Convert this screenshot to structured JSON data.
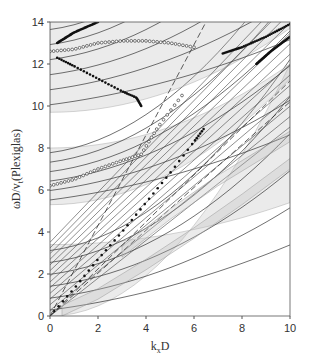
{
  "chart_data": {
    "type": "line",
    "title": "",
    "xlabel": "k_x D",
    "ylabel": "ωD/v_t (Plexiglas)",
    "xlim": [
      0,
      10
    ],
    "ylim": [
      0,
      14
    ],
    "xticks": [
      0,
      2,
      4,
      6,
      8,
      10
    ],
    "yticks": [
      0,
      2,
      4,
      6,
      8,
      10,
      12,
      14
    ],
    "grid": false,
    "legend": null,
    "series": [
      {
        "name": "dashed light line 1",
        "style": "dashed",
        "x": [
          0,
          6.5
        ],
        "y": [
          0,
          14
        ]
      },
      {
        "name": "dashed light line 2",
        "style": "dashed",
        "x": [
          0,
          10
        ],
        "y": [
          0,
          11.2
        ]
      },
      {
        "name": "dashed light line 3",
        "style": "dashed",
        "x": [
          0,
          10
        ],
        "y": [
          0,
          10.2
        ]
      },
      {
        "name": "lowest band (hatched)",
        "style": "band",
        "x": [
          0.5,
          2,
          4,
          6,
          8,
          10
        ],
        "y": [
          0,
          0.8,
          2.2,
          3.7,
          5.3,
          7.0
        ]
      },
      {
        "name": "second band (hatched)",
        "style": "band",
        "x": [
          3,
          5,
          7,
          10
        ],
        "y": [
          2.8,
          4.6,
          6.2,
          8.3
        ]
      },
      {
        "name": "filled-dot branch A",
        "style": "dots",
        "x": [
          0,
          1,
          2,
          3,
          4,
          5,
          6,
          6.4
        ],
        "y": [
          0,
          1.3,
          2.7,
          4.0,
          5.4,
          6.8,
          8.3,
          8.9
        ]
      },
      {
        "name": "filled-dot branch B (upper 12-10)",
        "style": "dots",
        "x": [
          0.3,
          1,
          2,
          3,
          3.6,
          3.8
        ],
        "y": [
          12.3,
          11.9,
          11.3,
          10.7,
          10.4,
          10.0
        ]
      },
      {
        "name": "filled-dot branch C",
        "style": "dots",
        "x": [
          0.3,
          1,
          2
        ],
        "y": [
          13.0,
          13.5,
          14.0
        ]
      },
      {
        "name": "open-circle branch D",
        "style": "circles",
        "x": [
          0,
          1,
          2,
          3,
          4,
          5,
          6
        ],
        "y": [
          12.6,
          12.7,
          13.0,
          13.1,
          13.1,
          13.0,
          12.8
        ]
      },
      {
        "name": "open-circle branch E",
        "style": "circles",
        "x": [
          0,
          1,
          2,
          3,
          3.8,
          4.5,
          5.5
        ],
        "y": [
          6.2,
          6.5,
          7.0,
          7.4,
          7.7,
          9.0,
          10.5
        ]
      },
      {
        "name": "filled-dot branch F",
        "style": "dots",
        "x": [
          7.2,
          8,
          9,
          10
        ],
        "y": [
          12.5,
          12.8,
          13.3,
          13.9
        ]
      },
      {
        "name": "filled-dot branch G",
        "style": "dots",
        "x": [
          8.6,
          9.2,
          10
        ],
        "y": [
          12.0,
          12.6,
          13.3
        ]
      }
    ],
    "bands_at_k0": [
      {
        "from": 0,
        "to": 3.4
      },
      {
        "from": 5.3,
        "to": 8.0
      },
      {
        "from": 9.7,
        "to": 14.0
      }
    ]
  },
  "axes": {
    "xlabel_main": "k",
    "xlabel_sub": "x",
    "xlabel_tail": "D",
    "ylabel": "ωD/v",
    "ylabel_sub": "t",
    "ylabel_tail": "(Plexiglas)",
    "xticks": [
      "0",
      "2",
      "4",
      "6",
      "8",
      "10"
    ],
    "yticks": [
      "0",
      "2",
      "4",
      "6",
      "8",
      "10",
      "12",
      "14"
    ]
  }
}
